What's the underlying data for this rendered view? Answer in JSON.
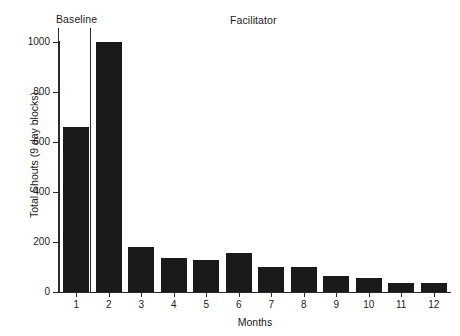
{
  "chart_data": {
    "type": "bar",
    "title": "",
    "xlabel": "Months",
    "ylabel": "Total Shouts (9 day blocks)",
    "categories": [
      "1",
      "2",
      "3",
      "4",
      "5",
      "6",
      "7",
      "8",
      "9",
      "10",
      "11",
      "12"
    ],
    "values": [
      660,
      1000,
      180,
      135,
      130,
      155,
      100,
      100,
      65,
      55,
      35,
      38
    ],
    "ylim": [
      0,
      1000
    ],
    "yticks": [
      0,
      200,
      400,
      600,
      800,
      1000
    ],
    "ytick_labels": [
      "0",
      "200",
      "400",
      "600",
      "800",
      "1000"
    ],
    "grid": false,
    "legend": "none",
    "bar_color": "#1a1a1a",
    "axis_color": "#2b2b2b",
    "annotations": [
      {
        "label": "Baseline",
        "phase": "baseline",
        "x_from": "1",
        "x_to": "2"
      },
      {
        "label": "Facilitator",
        "phase": "facilitator",
        "x_from": "2",
        "x_to": "12"
      }
    ]
  },
  "labels": {
    "baseline": "Baseline",
    "facilitator": "Facilitator"
  }
}
